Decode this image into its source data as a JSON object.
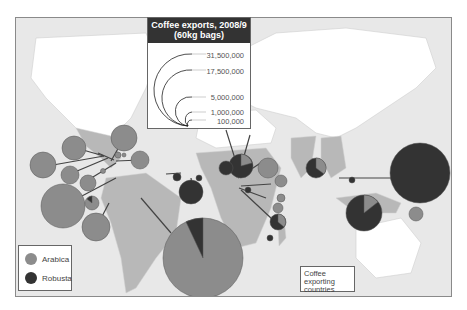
{
  "title": "Coffee exports, 2008/9",
  "subtitle": "(60kg bags)",
  "size_legend": {
    "values": [
      "31,500,000",
      "17,500,000",
      "5,000,000",
      "1,000,000",
      "100,000"
    ]
  },
  "type_legend": {
    "items": [
      {
        "label": "Arabica",
        "color": "#8c8c8c"
      },
      {
        "label": "Robusta",
        "color": "#333333"
      }
    ]
  },
  "country_legend": {
    "label": "Coffee exporting countries",
    "color": "#b8b8b8"
  },
  "colors": {
    "arabica": "#8c8c8c",
    "robusta": "#333333",
    "exporting_land": "#b8b8b8",
    "other_land": "#ffffff",
    "ocean": "#e8e8e8"
  }
}
